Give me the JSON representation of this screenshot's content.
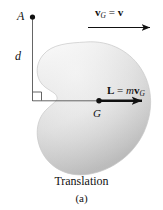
{
  "figure": {
    "caption": "Translation",
    "subcaption": "(a)",
    "background_color": "#ffffff",
    "ink_color": "#111111",
    "body_fill_light": "#fbfbfb",
    "body_fill_dark": "#b9b9b9"
  },
  "labels": {
    "point_a": "A",
    "distance_d": "d",
    "center_g": "G",
    "velocity_symbol": "v",
    "velocity_subscript": "G",
    "velocity_equals": "=",
    "velocity_rhs": "v",
    "momentum_symbol": "L",
    "momentum_equals": "=",
    "momentum_mass": "m",
    "momentum_velocity": "v",
    "momentum_subscript": "G"
  },
  "annotations": {
    "velocity_equation": "vG = v",
    "momentum_equation": "L = mvG",
    "right_angle_marker": "right-angle",
    "point_a_marker": "dot",
    "point_g_marker": "dot"
  }
}
